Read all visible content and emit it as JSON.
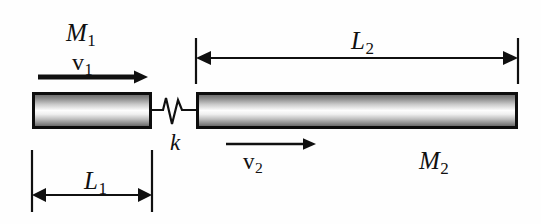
{
  "figure": {
    "background_color": "#fefefe",
    "ink_color": "#101010"
  },
  "labels": {
    "mass1": {
      "symbol": "M",
      "sub": "1",
      "text": "M1"
    },
    "mass2": {
      "symbol": "M",
      "sub": "2",
      "text": "M2"
    },
    "velocity1": {
      "symbol": "v",
      "sub": "1",
      "text": "v1"
    },
    "velocity2": {
      "symbol": "v",
      "sub": "2",
      "text": "v2"
    },
    "spring": {
      "symbol": "k",
      "text": "k"
    },
    "length1": {
      "symbol": "L",
      "sub": "1",
      "text": "L1"
    },
    "length2": {
      "symbol": "L",
      "sub": "2",
      "text": "L2"
    }
  },
  "bodies": [
    {
      "name": "mass-1",
      "label": "M1",
      "length_label": "L1",
      "velocity_label": "v1",
      "x": 32,
      "y": 92,
      "width": 120,
      "height": 37
    },
    {
      "name": "mass-2",
      "label": "M2",
      "length_label": "L2",
      "velocity_label": "v2",
      "x": 196,
      "y": 92,
      "width": 322,
      "height": 37
    }
  ],
  "connector": {
    "name": "spring",
    "label": "k",
    "type": "zigzag",
    "from_x": 152,
    "to_x": 196,
    "y": 110
  },
  "dimensions": [
    {
      "name": "L1",
      "label": "L1",
      "orientation": "horizontal",
      "position": "below",
      "x_start": 32,
      "x_end": 152,
      "y": 195,
      "arrowheads": "both"
    },
    {
      "name": "L2",
      "label": "L2",
      "orientation": "horizontal",
      "position": "above",
      "x_start": 196,
      "x_end": 518,
      "y": 58,
      "arrowheads": "both"
    }
  ],
  "vectors": [
    {
      "name": "v1",
      "label": "v1",
      "direction": "right",
      "x_start": 38,
      "x_end": 148,
      "y": 77,
      "thickness": "thick"
    },
    {
      "name": "v2",
      "label": "v2",
      "direction": "right",
      "x_start": 226,
      "x_end": 316,
      "y": 144,
      "thickness": "thin"
    }
  ]
}
